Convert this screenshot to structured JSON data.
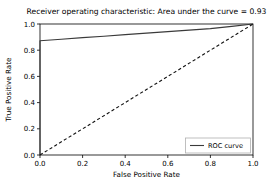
{
  "chart_data": {
    "type": "line",
    "title": "Receiver operating characteristic: Area under the curve = 0.93",
    "xlabel": "False Positive Rate",
    "ylabel": "True Positive Rate",
    "xlim": [
      0.0,
      1.0
    ],
    "ylim": [
      0.0,
      1.0
    ],
    "xticks": [
      "0.0",
      "0.2",
      "0.4",
      "0.6",
      "0.8",
      "1.0"
    ],
    "xtick_values": [
      0.0,
      0.2,
      0.4,
      0.6,
      0.8,
      1.0
    ],
    "yticks": [
      "0.0",
      "0.2",
      "0.4",
      "0.6",
      "0.8",
      "1.0"
    ],
    "ytick_values": [
      0.0,
      0.2,
      0.4,
      0.6,
      0.8,
      1.0
    ],
    "grid": false,
    "legend_position": "lower right",
    "auc": 0.93,
    "series": [
      {
        "name": "ROC curve",
        "style": "solid",
        "color": "#3a3a3a",
        "x": [
          0.0,
          0.0,
          0.1,
          0.2,
          0.3,
          0.4,
          0.5,
          0.6,
          0.7,
          0.8,
          0.9,
          1.0
        ],
        "y": [
          0.0,
          0.872,
          0.884,
          0.896,
          0.907,
          0.919,
          0.93,
          0.942,
          0.953,
          0.965,
          0.982,
          1.0
        ]
      },
      {
        "name": "chance-diagonal",
        "style": "dashed",
        "color": "#111111",
        "x": [
          0.0,
          1.0
        ],
        "y": [
          0.0,
          1.0
        ]
      }
    ]
  },
  "legend": {
    "entries": [
      {
        "label": "ROC curve",
        "color": "#3a3a3a",
        "style": "solid"
      }
    ]
  },
  "plot_geometry": {
    "left": 40,
    "right": 253,
    "top": 24,
    "bottom": 155
  }
}
